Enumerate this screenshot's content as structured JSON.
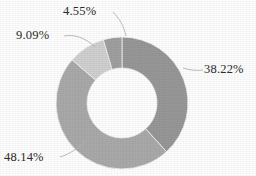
{
  "chart_data": {
    "type": "pie",
    "variant": "donut",
    "title": "",
    "subtitle": "",
    "xlabel": "",
    "ylabel": "",
    "grid": false,
    "legend": "none",
    "labels_position": "outside-with-leader-lines",
    "start_angle_deg": 0,
    "direction": "clockwise",
    "inner_radius_ratio": 0.53,
    "categories": [
      "38.22%",
      "48.14%",
      "9.09%",
      "4.55%"
    ],
    "values": [
      38.22,
      48.14,
      9.09,
      4.55
    ],
    "slices": [
      {
        "label": "38.22%",
        "value": 38.22,
        "color": "#979797",
        "label_id": "label-1"
      },
      {
        "label": "48.14%",
        "value": 48.14,
        "color": "#a9a9a9",
        "label_id": "label-2"
      },
      {
        "label": "9.09%",
        "value": 9.09,
        "color": "#cfcfcf",
        "label_id": "label-3"
      },
      {
        "label": "4.55%",
        "value": 4.55,
        "color": "#9f9f9f",
        "label_id": "label-4"
      }
    ]
  },
  "chart": {
    "center_x": 122,
    "center_y": 103,
    "outer_radius": 66,
    "inner_radius": 35,
    "background_color": "#fdfdfd",
    "label_color": "#2b2b2b",
    "leader_line_color": "#b4b4b4",
    "slice_border_color": "#f2f2f2"
  },
  "labels": {
    "slice_1": "38.22%",
    "slice_2": "48.14%",
    "slice_3": "9.09%",
    "slice_4": "4.55%"
  }
}
